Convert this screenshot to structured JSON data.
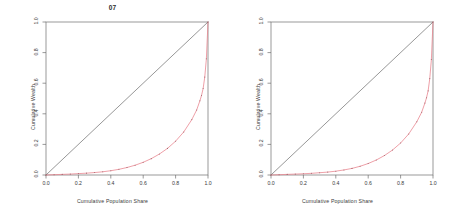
{
  "figure": {
    "background": "#ffffff",
    "panel_count": 2
  },
  "chart_data": [
    {
      "type": "line",
      "title": "07",
      "xlabel": "Cumulative Population Share",
      "ylabel": "Cumulative Wealth",
      "xlim": [
        0.0,
        1.0
      ],
      "ylim": [
        0.0,
        1.0
      ],
      "xticks": [
        "0.0",
        "0.2",
        "0.4",
        "0.6",
        "0.8",
        "1.0"
      ],
      "xtick_values": [
        0.0,
        0.2,
        0.4,
        0.6,
        0.8,
        1.0
      ],
      "yticks": [
        "0.0",
        "0.2",
        "0.4",
        "0.6",
        "0.8",
        "1.0"
      ],
      "ytick_values": [
        0.0,
        0.2,
        0.4,
        0.6,
        0.8,
        1.0
      ],
      "grid": false,
      "legend": "none",
      "series": [
        {
          "name": "Line of Equality",
          "color": "#5a5a5a",
          "style": "solid",
          "marker": "none",
          "x": [
            0.0,
            1.0
          ],
          "values": [
            0.0,
            1.0
          ]
        },
        {
          "name": "Lorenz Curve",
          "color": "#e8828c",
          "style": "solid",
          "marker": "point",
          "x": [
            0.0,
            0.05,
            0.1,
            0.15,
            0.2,
            0.25,
            0.3,
            0.35,
            0.4,
            0.45,
            0.5,
            0.55,
            0.6,
            0.65,
            0.7,
            0.75,
            0.8,
            0.85,
            0.9,
            0.93,
            0.95,
            0.96,
            0.97,
            0.98,
            0.99,
            1.0
          ],
          "values": [
            0.0,
            0.002,
            0.004,
            0.006,
            0.009,
            0.012,
            0.016,
            0.021,
            0.028,
            0.037,
            0.049,
            0.064,
            0.083,
            0.107,
            0.137,
            0.174,
            0.221,
            0.281,
            0.362,
            0.425,
            0.485,
            0.52,
            0.565,
            0.64,
            0.76,
            1.0
          ]
        }
      ]
    },
    {
      "type": "line",
      "title": "",
      "xlabel": "Cumulative Population Share",
      "ylabel": "Cumulative Wealth",
      "xlim": [
        0.0,
        1.0
      ],
      "ylim": [
        0.0,
        1.0
      ],
      "xticks": [
        "0.0",
        "0.2",
        "0.4",
        "0.6",
        "0.8",
        "1.0"
      ],
      "xtick_values": [
        0.0,
        0.2,
        0.4,
        0.6,
        0.8,
        1.0
      ],
      "yticks": [
        "0.0",
        "0.2",
        "0.4",
        "0.6",
        "0.8",
        "1.0"
      ],
      "ytick_values": [
        0.0,
        0.2,
        0.4,
        0.6,
        0.8,
        1.0
      ],
      "grid": false,
      "legend": "none",
      "series": [
        {
          "name": "Line of Equality",
          "color": "#5a5a5a",
          "style": "solid",
          "marker": "none",
          "x": [
            0.0,
            1.0
          ],
          "values": [
            0.0,
            1.0
          ]
        },
        {
          "name": "Lorenz Curve",
          "color": "#e8828c",
          "style": "solid",
          "marker": "point",
          "x": [
            0.0,
            0.05,
            0.1,
            0.15,
            0.2,
            0.25,
            0.3,
            0.35,
            0.4,
            0.45,
            0.5,
            0.55,
            0.6,
            0.65,
            0.7,
            0.75,
            0.8,
            0.85,
            0.9,
            0.93,
            0.95,
            0.96,
            0.97,
            0.98,
            0.99,
            1.0
          ],
          "values": [
            0.0,
            0.002,
            0.004,
            0.006,
            0.008,
            0.011,
            0.015,
            0.019,
            0.025,
            0.033,
            0.043,
            0.057,
            0.075,
            0.098,
            0.127,
            0.163,
            0.209,
            0.268,
            0.348,
            0.41,
            0.47,
            0.505,
            0.55,
            0.63,
            0.755,
            1.0
          ]
        }
      ]
    }
  ],
  "colors": {
    "axis": "#6e6e6e",
    "equality_line": "#5a5a5a",
    "lorenz_curve": "#e8828c",
    "text": "#3a3a3a",
    "title": "#2b2b2b",
    "background": "#ffffff"
  }
}
